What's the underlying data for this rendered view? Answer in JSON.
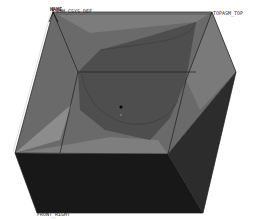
{
  "viewport": {
    "type": "3d-model-view",
    "background": "#ffffff",
    "colors": {
      "top_face": "#6e6e6e",
      "top_face_light": "#8a8a8a",
      "inner_surface": "#4a4a4a",
      "front_face": "#181818",
      "right_face": "#2c2c2c",
      "edge": "#1e1e1e",
      "highlight_edge": "#d8d8d8"
    }
  },
  "datum_labels": {
    "csys_name": "NAME",
    "csys": "ASM_CSYS_DEF",
    "top": "TOPASM_TOP",
    "bottom": "FRONT_RIGHT"
  },
  "marker": {
    "type": "origin-point"
  }
}
